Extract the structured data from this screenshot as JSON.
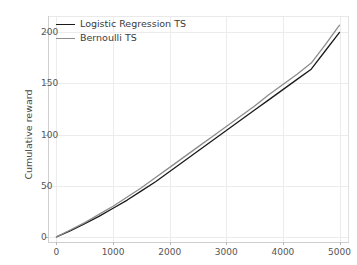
{
  "chart_data": {
    "type": "line",
    "title": "",
    "xlabel": "",
    "ylabel": "Cumulative reward",
    "xlim": [
      -150,
      5150
    ],
    "ylim": [
      -5,
      216
    ],
    "grid": true,
    "legend_position": "upper left",
    "x_ticks": [
      "0",
      "1000",
      "2000",
      "3000",
      "4000",
      "5000"
    ],
    "x_tick_values": [
      0,
      1000,
      2000,
      3000,
      4000,
      5000
    ],
    "y_ticks": [
      "0",
      "50",
      "100",
      "150",
      "200"
    ],
    "y_tick_values": [
      0,
      50,
      100,
      150,
      200
    ],
    "x": [
      0,
      250,
      500,
      750,
      1000,
      1250,
      1500,
      1750,
      2000,
      2250,
      2500,
      2750,
      3000,
      3250,
      3500,
      3750,
      4000,
      4250,
      4500,
      4750,
      5000
    ],
    "series": [
      {
        "name": "Logistic Regression TS",
        "color": "#1a1a1a",
        "values": [
          0,
          6,
          13,
          20,
          28,
          36,
          45,
          54,
          64,
          74,
          84,
          94,
          104,
          114,
          124,
          134,
          144,
          154,
          164,
          182,
          200
        ]
      },
      {
        "name": "Bernoulli TS",
        "color": "#8c8c8c",
        "values": [
          0,
          7,
          14,
          22,
          30,
          39,
          48,
          58,
          68,
          78,
          88,
          98,
          108,
          118,
          128,
          139,
          149,
          159,
          170,
          188,
          207
        ]
      }
    ]
  },
  "legend": {
    "entries": [
      {
        "label": "Logistic Regression TS",
        "color": "#1a1a1a"
      },
      {
        "label": "Bernoulli TS",
        "color": "#8c8c8c"
      }
    ]
  },
  "axes": {
    "y_label": "Cumulative reward"
  },
  "colors": {
    "background": "#ffffff",
    "grid": "#ececec",
    "spine": "#cfcfcf",
    "tick_text": "#555555",
    "series_primary": "#1a1a1a",
    "series_secondary": "#8c8c8c"
  }
}
